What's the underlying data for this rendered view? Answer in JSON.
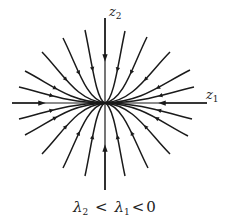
{
  "figure": {
    "type": "phase-portrait",
    "node_type": "stable node",
    "axes": {
      "horizontal": {
        "symbol": "z",
        "subscript": "1"
      },
      "vertical": {
        "symbol": "z",
        "subscript": "2"
      }
    },
    "caption": {
      "lambda2": "λ",
      "lambda2_sub": "2",
      "lt1": "<",
      "lambda1": "λ",
      "lambda1_sub": "1",
      "lt2": "<",
      "zero": "0"
    },
    "colors": {
      "line": "#1a1a1a",
      "background": "#ffffff"
    },
    "origin": [
      105,
      103
    ],
    "trajectory_starts": [
      [
        85,
        30
      ],
      [
        63,
        38
      ],
      [
        42,
        52
      ],
      [
        25,
        71
      ],
      [
        19,
        87
      ],
      [
        125,
        31
      ],
      [
        147,
        37
      ],
      [
        170,
        52
      ],
      [
        190,
        70
      ],
      [
        194,
        87
      ],
      [
        85,
        176
      ],
      [
        63,
        168
      ],
      [
        42,
        154
      ],
      [
        25,
        135
      ],
      [
        19,
        119
      ],
      [
        125,
        176
      ],
      [
        148,
        168
      ],
      [
        170,
        154
      ],
      [
        188,
        136
      ],
      [
        192,
        119
      ]
    ]
  }
}
